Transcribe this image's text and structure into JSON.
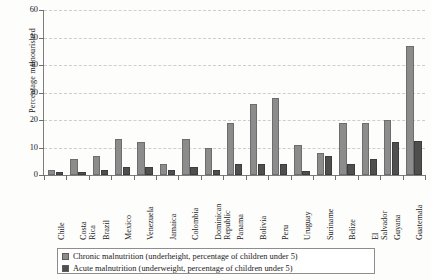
{
  "chart_data": {
    "type": "bar",
    "title": "",
    "xlabel": "",
    "ylabel": "Percentage malnourished",
    "ylim": [
      0,
      60
    ],
    "yticks": [
      0,
      10,
      20,
      30,
      40,
      50,
      60
    ],
    "grid": true,
    "legend_position": "bottom",
    "categories": [
      "Chile",
      "Costa Rica",
      "Brazil",
      "Mexico",
      "Venezuela",
      "Jamaica",
      "Colombia",
      "Dominican Republic",
      "Panama",
      "Bolivia",
      "Peru",
      "Uruguay",
      "Suriname",
      "Belize",
      "El Salvador",
      "Guyana",
      "Guatemala"
    ],
    "series": [
      {
        "name": "Chronic malnutrition (underheight, percentage of children under 5)",
        "color": "#8c8c8c",
        "values": [
          2,
          6,
          7,
          13,
          12,
          4,
          13,
          10,
          19,
          26,
          28,
          11,
          8,
          19,
          19,
          20,
          47
        ]
      },
      {
        "name": "Acute malnutrition (underweight, percentage of children under 5)",
        "color": "#4f4f4f",
        "values": [
          1,
          1,
          2,
          3,
          3,
          2,
          3,
          2,
          4,
          4,
          4,
          1.5,
          7,
          4,
          6,
          12,
          12.5
        ]
      }
    ]
  },
  "legend": {
    "items": [
      {
        "icon": "square-swatch-light",
        "label": "Chronic malnutrition (underheight, percentage of children under 5)"
      },
      {
        "icon": "square-swatch-dark",
        "label": "Acute malnutrition (underweight, percentage of children under 5)"
      }
    ]
  },
  "axes": {
    "y_title": "Percentage malnourished",
    "y_tick_labels": [
      "0",
      "10",
      "20",
      "30",
      "40",
      "50",
      "60"
    ]
  }
}
